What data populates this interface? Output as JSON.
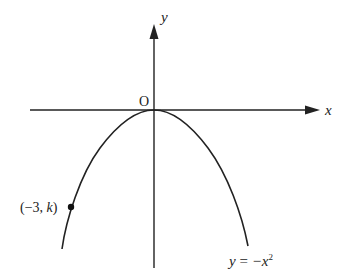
{
  "diagram": {
    "type": "function-graph",
    "axes": {
      "x_label": "x",
      "y_label": "y",
      "origin_label": "O"
    },
    "curve": {
      "equation_lhs": "y",
      "equation_eq": " = ",
      "equation_rhs": "−x",
      "equation_exp": "2",
      "description": "downward parabola with vertex at origin"
    },
    "point": {
      "label_open": "(−3, ",
      "label_var": "k",
      "label_close": ")",
      "x": -3
    },
    "colors": {
      "stroke": "#222222",
      "background": "#ffffff"
    }
  }
}
